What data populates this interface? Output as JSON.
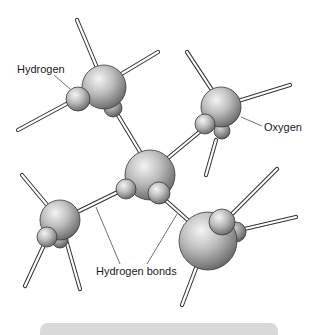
{
  "figure": {
    "labels": {
      "hydrogen": "Hydrogen",
      "oxygen": "Oxygen",
      "hydrogen_bonds": "Hydrogen bonds"
    },
    "molecules": [
      {
        "id": "top-left",
        "atoms": [
          "oxygen",
          "hydrogen",
          "hydrogen"
        ]
      },
      {
        "id": "top-right",
        "atoms": [
          "oxygen",
          "hydrogen",
          "hydrogen"
        ]
      },
      {
        "id": "center",
        "atoms": [
          "oxygen",
          "hydrogen",
          "hydrogen"
        ]
      },
      {
        "id": "bottom-left",
        "atoms": [
          "oxygen",
          "hydrogen",
          "hydrogen"
        ]
      },
      {
        "id": "bottom-right",
        "atoms": [
          "oxygen",
          "hydrogen",
          "hydrogen"
        ]
      }
    ],
    "colors": {
      "atom_light": "#f2f2f2",
      "atom_mid": "#a6a6a6",
      "atom_dark": "#5e5e5e",
      "bond": "#ffffff",
      "outline": "#333333",
      "leader_line": "#333333",
      "bottom_bar": "#d9d9d9"
    }
  }
}
